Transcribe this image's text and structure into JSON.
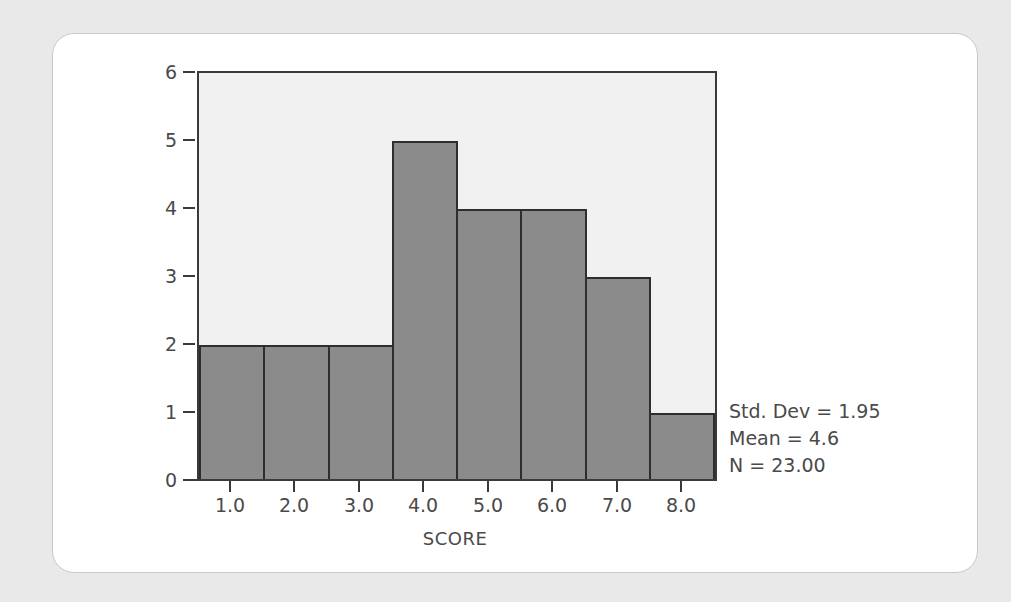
{
  "chart_data": {
    "type": "bar",
    "title": "",
    "subtitle": "",
    "xlabel": "SCORE",
    "ylabel": "",
    "categories": [
      "1.0",
      "2.0",
      "3.0",
      "4.0",
      "5.0",
      "6.0",
      "7.0",
      "8.0"
    ],
    "values": [
      2,
      2,
      2,
      5,
      4,
      4,
      3,
      1
    ],
    "x": [
      1.0,
      2.0,
      3.0,
      4.0,
      5.0,
      6.0,
      7.0,
      8.0
    ],
    "xlim": [
      0.5,
      8.5
    ],
    "ylim": [
      0,
      6
    ],
    "ytick_labels": [
      "6",
      "5",
      "4",
      "3",
      "2",
      "1",
      "0"
    ],
    "ytick_values": [
      6,
      5,
      4,
      3,
      2,
      1,
      0
    ],
    "xtick_labels": [
      "1.0",
      "2.0",
      "3.0",
      "4.0",
      "5.0",
      "6.0",
      "7.0",
      "8.0"
    ],
    "grid": false,
    "legend": null,
    "annotations": [
      "Std. Dev = 1.95",
      "Mean = 4.6",
      "N = 23.00"
    ],
    "statistics": {
      "std_dev_label": "Std. Dev = 1.95",
      "std_dev": 1.95,
      "mean_label": "Mean = 4.6",
      "mean": 4.6,
      "n_label": "N = 23.00",
      "n": 23.0
    },
    "colors": {
      "bar_fill": "#8b8b8b",
      "bar_edge": "#2e2e2e",
      "plot_background": "#f1f1f1",
      "axis": "#3a3a3a",
      "text": "#4a4a4a",
      "card_background": "#ffffff",
      "page_background": "#e9e9e9"
    }
  }
}
